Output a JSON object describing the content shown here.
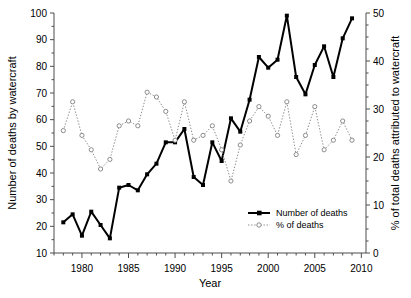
{
  "chart_data": {
    "type": "line",
    "title": "",
    "xlabel": "Year",
    "ylabel": "Number of deaths by watercraft",
    "y2label": "% of total deaths attributed to watercraft",
    "xlim": [
      1977,
      2010.5
    ],
    "ylim": [
      10,
      100
    ],
    "y2lim": [
      0,
      50
    ],
    "xticks": [
      1980,
      1985,
      1990,
      1995,
      2000,
      2005,
      2010
    ],
    "xtick_labels": [
      "1980",
      "1985",
      "1990",
      "1995",
      "2000",
      "2005",
      "2010"
    ],
    "xminor_step": 1,
    "yticks": [
      10,
      20,
      30,
      40,
      50,
      60,
      70,
      80,
      90,
      100
    ],
    "ytick_labels": [
      "10",
      "20",
      "30",
      "40",
      "50",
      "60",
      "70",
      "80",
      "90",
      "100"
    ],
    "yminor_step": 5,
    "y2ticks": [
      0,
      10,
      20,
      30,
      40,
      50
    ],
    "y2tick_labels": [
      "0",
      "10",
      "20",
      "30",
      "40",
      "50"
    ],
    "y2minor_step": 2.5,
    "grid": false,
    "legend_position": "bottom-right",
    "x": [
      1978,
      1979,
      1980,
      1981,
      1982,
      1983,
      1984,
      1985,
      1986,
      1987,
      1988,
      1989,
      1990,
      1991,
      1992,
      1993,
      1994,
      1995,
      1996,
      1997,
      1998,
      1999,
      2000,
      2001,
      2002,
      2003,
      2004,
      2005,
      2006,
      2007,
      2008,
      2009
    ],
    "series": [
      {
        "name": "Number of deaths",
        "axis": "left",
        "style": "solid-line-filled-square",
        "color": "#000000",
        "values": [
          21.5,
          24.5,
          16.5,
          25.5,
          20.5,
          15.5,
          34.5,
          35.5,
          33.5,
          39.5,
          43.5,
          51.5,
          51.5,
          56.5,
          38.5,
          35.5,
          51.5,
          44.5,
          60.5,
          55.5,
          67.5,
          83.5,
          79.5,
          82.5,
          99.0,
          76.0,
          69.5,
          80.5,
          87.5,
          76.0,
          90.5,
          98.0
        ]
      },
      {
        "name": "% of deaths",
        "axis": "right",
        "style": "dotted-line-open-circle",
        "color": "#8c8c8c",
        "values": [
          25.5,
          31.5,
          24.5,
          21.5,
          17.5,
          19.5,
          26.5,
          27.5,
          26.5,
          33.5,
          32.5,
          29.5,
          23.5,
          31.5,
          23.5,
          24.5,
          26.5,
          21.5,
          15.0,
          22.5,
          27.5,
          30.5,
          28.5,
          24.5,
          31.5,
          20.5,
          24.5,
          30.5,
          21.5,
          23.5,
          27.5,
          23.5
        ]
      }
    ]
  },
  "legend": {
    "entries": [
      {
        "label": "Number of deaths"
      },
      {
        "label": "% of deaths"
      }
    ]
  }
}
